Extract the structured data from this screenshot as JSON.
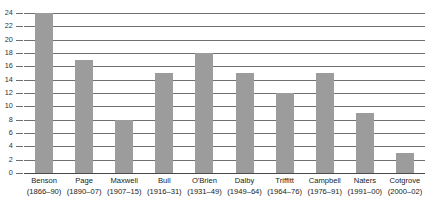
{
  "chart_data": {
    "type": "bar",
    "title": "",
    "subtitle": "",
    "xlabel": "",
    "ylabel": "",
    "ylim": [
      0,
      24
    ],
    "ytick_step": 2,
    "yticks": [
      24,
      22,
      20,
      18,
      16,
      14,
      12,
      10,
      8,
      6,
      4,
      2,
      0
    ],
    "grid": true,
    "legend": false,
    "legend_position": "none",
    "orientation": "vertical",
    "bar_color": "#9c9c9c",
    "gridline_color": "#6f6f6f",
    "axis_color": "#4a4a4a",
    "categories": [
      "Benson",
      "Page",
      "Maxwell",
      "Bull",
      "O'Brien",
      "Dalby",
      "Triffitt",
      "Campbell",
      "Naters",
      "Cotgrove"
    ],
    "category_subtitles": [
      "(1866–90)",
      "(1890–07)",
      "(1907–15)",
      "(1916–31)",
      "(1931–49)",
      "(1949–64)",
      "(1964–76)",
      "(1976–91)",
      "(1991–00)",
      "(2000–02)"
    ],
    "values": [
      24,
      17,
      8,
      15,
      18,
      15,
      12,
      15,
      9,
      3
    ],
    "bars": [
      {
        "name": "Benson",
        "years": "(1866–90)",
        "value": 24
      },
      {
        "name": "Page",
        "years": "(1890–07)",
        "value": 17
      },
      {
        "name": "Maxwell",
        "years": "(1907–15)",
        "value": 8
      },
      {
        "name": "Bull",
        "years": "(1916–31)",
        "value": 15
      },
      {
        "name": "O'Brien",
        "years": "(1931–49)",
        "value": 18
      },
      {
        "name": "Dalby",
        "years": "(1949–64)",
        "value": 15
      },
      {
        "name": "Triffitt",
        "years": "(1964–76)",
        "value": 12
      },
      {
        "name": "Campbell",
        "years": "(1976–91)",
        "value": 15
      },
      {
        "name": "Naters",
        "years": "(1991–00)",
        "value": 9
      },
      {
        "name": "Cotgrove",
        "years": "(2000–02)",
        "value": 3
      }
    ]
  }
}
